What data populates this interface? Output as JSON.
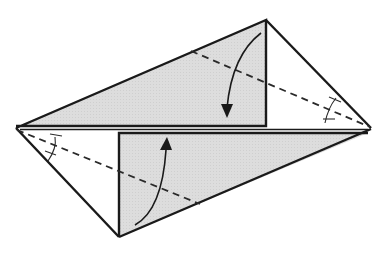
{
  "diagram": {
    "type": "origami-fold-instruction",
    "colors": {
      "paper_face": "#ffffff",
      "paper_shaded": "#dcdcdc",
      "outline": "#1a1a1a",
      "background": "#ffffff"
    },
    "vertices": {
      "left_point": [
        16,
        128
      ],
      "right_point": [
        370,
        128
      ],
      "top_point": [
        266,
        20
      ],
      "bottom_point": [
        119,
        237
      ]
    },
    "flaps": [
      {
        "name": "upper-flap",
        "fold_direction": "down",
        "shaded": true
      },
      {
        "name": "lower-flap",
        "fold_direction": "up",
        "shaded": true
      }
    ],
    "fold_lines": [
      {
        "name": "upper-valley-fold",
        "style": "dashed",
        "from": [
          16,
          128
        ],
        "to": [
          370,
          128
        ],
        "via_direction": "right-point-to-left"
      },
      {
        "name": "lower-valley-fold",
        "style": "dashed"
      }
    ],
    "angle_marks": [
      {
        "location": "left-point",
        "marks": 2
      },
      {
        "location": "right-point",
        "marks": 2
      }
    ]
  }
}
